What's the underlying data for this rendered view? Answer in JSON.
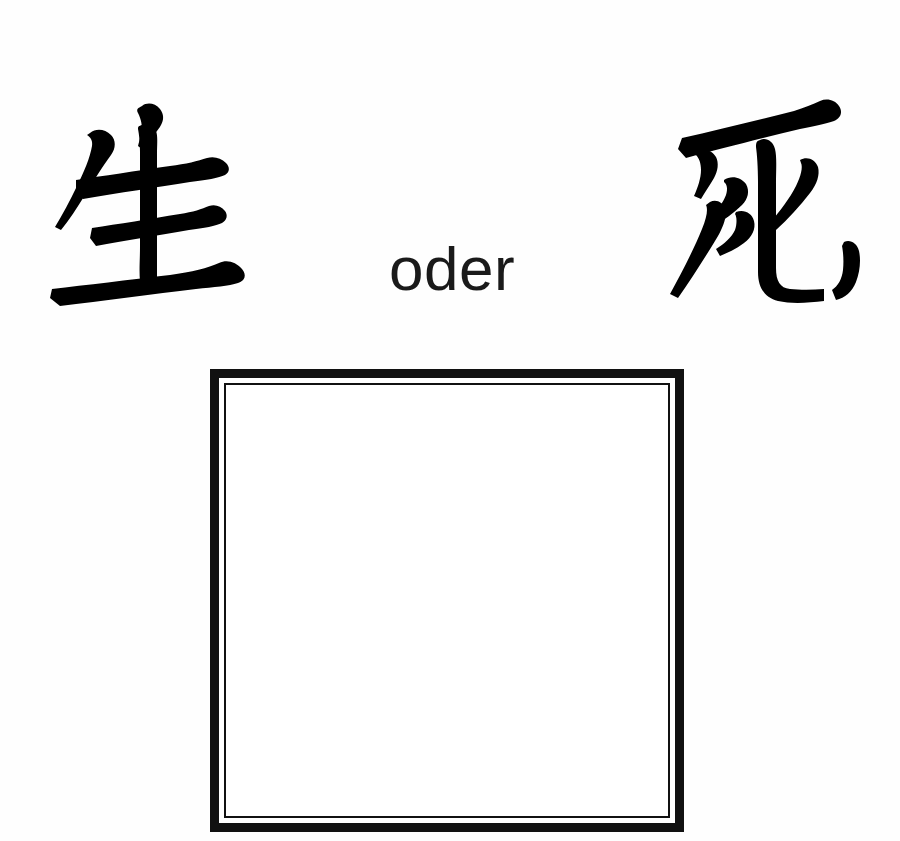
{
  "page": {
    "background_color": "#fefefe",
    "ink_color": "#000000",
    "width": 900,
    "height": 841
  },
  "prompt": {
    "left_glyph": {
      "character": "生",
      "meaning": "life",
      "romanization": "sei / shou",
      "icon_name": "kanji-life-glyph"
    },
    "conjunction": {
      "text": "oder",
      "language": "German",
      "meaning": "or"
    },
    "right_glyph": {
      "character": "死",
      "meaning": "death",
      "romanization": "shi",
      "icon_name": "kanji-death-glyph"
    }
  },
  "answer_box": {
    "label": "",
    "value": "",
    "placeholder": "",
    "border_color": "#111111",
    "fill_color": "#ffffff",
    "style": "double-rule",
    "outer_border_px": 9,
    "gap_px": 5,
    "inner_border_px": 2
  }
}
